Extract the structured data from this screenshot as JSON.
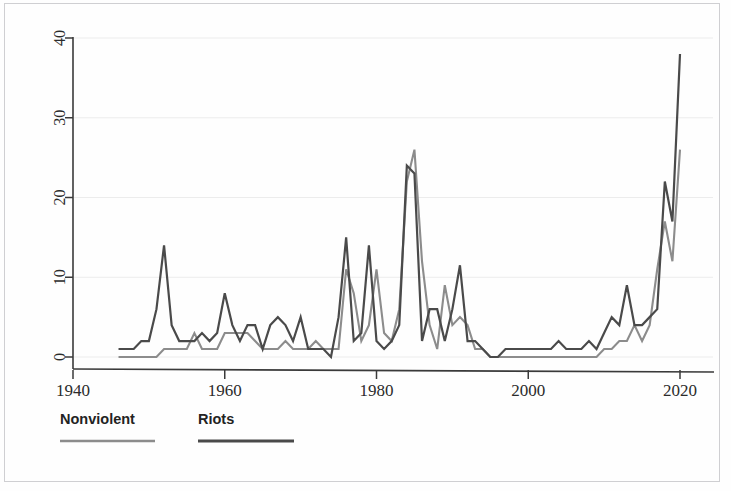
{
  "figure": {
    "background_color": "#fefefe",
    "frame_color": "#cfcfd2",
    "axis_color": "#3a3a3a",
    "grid_color": "#ececec"
  },
  "chart_data": {
    "type": "line",
    "title": "",
    "subtitle": "",
    "xlabel": "",
    "ylabel": "",
    "xlim": [
      1938,
      2022
    ],
    "ylim": [
      0,
      42
    ],
    "xticks": [
      1940,
      1960,
      1980,
      2000,
      2020
    ],
    "xtick_labels": [
      "1940",
      "1960",
      "1980",
      "2000",
      "2020"
    ],
    "yticks": [
      0,
      10,
      20,
      30,
      40
    ],
    "ytick_labels": [
      "0",
      "10",
      "20",
      "30",
      "40"
    ],
    "grid": "horizontal-faint",
    "legend_position": "below-left",
    "ytick_label_rotation": -90,
    "series": [
      {
        "name": "Nonviolent",
        "color": "#8c8c8c",
        "line_width": 2.1,
        "x": [
          1946,
          1947,
          1948,
          1949,
          1950,
          1951,
          1952,
          1953,
          1954,
          1955,
          1956,
          1957,
          1958,
          1959,
          1960,
          1961,
          1962,
          1963,
          1964,
          1965,
          1966,
          1967,
          1968,
          1969,
          1970,
          1971,
          1972,
          1973,
          1974,
          1975,
          1976,
          1977,
          1978,
          1979,
          1980,
          1981,
          1982,
          1983,
          1984,
          1985,
          1986,
          1987,
          1988,
          1989,
          1990,
          1991,
          1992,
          1993,
          1994,
          1995,
          1996,
          1997,
          1998,
          1999,
          2000,
          2001,
          2002,
          2003,
          2004,
          2005,
          2006,
          2007,
          2008,
          2009,
          2010,
          2011,
          2012,
          2013,
          2014,
          2015,
          2016,
          2017,
          2018,
          2019,
          2020
        ],
        "values": [
          0,
          0,
          0,
          0,
          0,
          0,
          1,
          1,
          1,
          1,
          3,
          1,
          1,
          1,
          3,
          3,
          3,
          3,
          2,
          1,
          1,
          1,
          2,
          1,
          1,
          1,
          2,
          1,
          1,
          1,
          11,
          8,
          2,
          4,
          11,
          3,
          2,
          6,
          22,
          26,
          12,
          4,
          1,
          9,
          4,
          5,
          4,
          1,
          1,
          0,
          0,
          0,
          0,
          0,
          0,
          0,
          0,
          0,
          0,
          0,
          0,
          0,
          0,
          0,
          1,
          1,
          2,
          2,
          4,
          2,
          4,
          11,
          17,
          12,
          26
        ]
      },
      {
        "name": "Riots",
        "color": "#4a4a4a",
        "line_width": 2.2,
        "x": [
          1946,
          1947,
          1948,
          1949,
          1950,
          1951,
          1952,
          1953,
          1954,
          1955,
          1956,
          1957,
          1958,
          1959,
          1960,
          1961,
          1962,
          1963,
          1964,
          1965,
          1966,
          1967,
          1968,
          1969,
          1970,
          1971,
          1972,
          1973,
          1974,
          1975,
          1976,
          1977,
          1978,
          1979,
          1980,
          1981,
          1982,
          1983,
          1984,
          1985,
          1986,
          1987,
          1988,
          1989,
          1990,
          1991,
          1992,
          1993,
          1994,
          1995,
          1996,
          1997,
          1998,
          1999,
          2000,
          2001,
          2002,
          2003,
          2004,
          2005,
          2006,
          2007,
          2008,
          2009,
          2010,
          2011,
          2012,
          2013,
          2014,
          2015,
          2016,
          2017,
          2018,
          2019,
          2020
        ],
        "values": [
          1,
          1,
          1,
          2,
          2,
          6,
          14,
          4,
          2,
          2,
          2,
          3,
          2,
          3,
          8,
          4,
          2,
          4,
          4,
          1,
          4,
          5,
          4,
          2,
          5,
          1,
          1,
          1,
          0,
          5,
          15,
          2,
          3,
          14,
          2,
          1,
          2,
          4,
          24,
          23,
          2,
          6,
          6,
          2,
          6,
          11.5,
          2,
          2,
          1,
          0,
          0,
          1,
          1,
          1,
          1,
          1,
          1,
          1,
          2,
          1,
          1,
          1,
          2,
          1,
          3,
          5,
          4,
          9,
          4,
          4,
          5,
          6,
          22,
          17,
          38
        ]
      }
    ],
    "annotations": []
  },
  "legend": {
    "entries": [
      {
        "label": "Nonviolent",
        "color": "#8c8c8c"
      },
      {
        "label": "Riots",
        "color": "#4a4a4a"
      }
    ]
  }
}
